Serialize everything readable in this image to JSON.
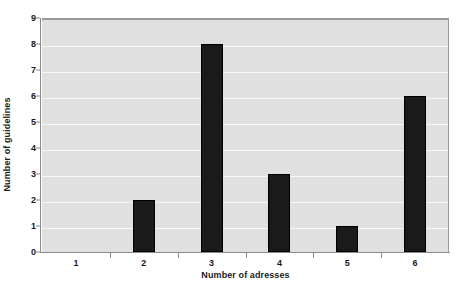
{
  "chart_data": {
    "type": "bar",
    "title": "",
    "subtitle": "",
    "categories": [
      "1",
      "2",
      "3",
      "4",
      "5",
      "6"
    ],
    "values": [
      0,
      2,
      8,
      3,
      1,
      6
    ],
    "xlabel": "Number of adresses",
    "ylabel": "Number of guidelines",
    "ylim": [
      0,
      9
    ],
    "xlim": [
      0.5,
      6.5
    ],
    "yticks": [
      "0",
      "1",
      "2",
      "3",
      "4",
      "5",
      "6",
      "7",
      "8",
      "9"
    ],
    "ytick_values": [
      0,
      1,
      2,
      3,
      4,
      5,
      6,
      7,
      8,
      9
    ],
    "grid": "horizontal",
    "legend": "none",
    "annotations": [],
    "colors": {
      "bar": "#1a1a1a",
      "plot_background": "#e0e0e0",
      "page_background": "#ffffff",
      "gridline": "#f7f7f7",
      "axis": "#8c8c8c",
      "text": "#1a1a1a"
    }
  }
}
